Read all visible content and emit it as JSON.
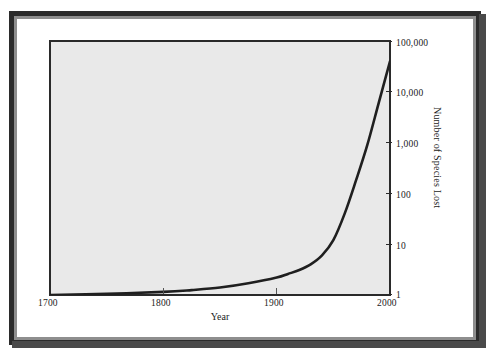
{
  "figure": {
    "background_color": "#ffffff",
    "frame_color": "#2b2b2b",
    "frame_inner_color": "#8e8e8e",
    "plot_background_color": "#e9e9e9",
    "curve_color": "#1f1f1f"
  },
  "chart_data": {
    "type": "line",
    "title": "",
    "subtitle": "",
    "xlabel": "Year",
    "ylabel": "Number of Species Lost",
    "xlim": [
      1700,
      2000
    ],
    "ylim": [
      1,
      100000
    ],
    "yscale": "log",
    "xscale": "linear",
    "grid": false,
    "legend": null,
    "xticks": [
      1700,
      1800,
      1900,
      2000
    ],
    "xtick_labels": [
      "1700",
      "1800",
      "1900",
      "2000"
    ],
    "yticks": [
      1,
      10,
      100,
      1000,
      10000,
      100000
    ],
    "ytick_labels": [
      "1",
      "10",
      "100",
      "1,000",
      "10,000",
      "100,000"
    ],
    "ytick_side": "right",
    "ylabel_side": "right",
    "series": [
      {
        "name": "Species lost",
        "x": [
          1700,
          1750,
          1800,
          1825,
          1850,
          1875,
          1900,
          1910,
          1920,
          1930,
          1940,
          1950,
          1960,
          1970,
          1980,
          1990,
          2000
        ],
        "y": [
          1.0,
          1.05,
          1.15,
          1.25,
          1.4,
          1.7,
          2.2,
          2.6,
          3.1,
          4.0,
          6.0,
          12.0,
          40.0,
          180.0,
          900.0,
          6000.0,
          40000.0
        ]
      }
    ],
    "annotations": []
  },
  "axis": {
    "x_title": "Year",
    "y_title": "Number of Species Lost",
    "x_tick_labels": [
      "1700",
      "1800",
      "1900",
      "2000"
    ],
    "y_tick_labels": [
      "100,000",
      "10,000",
      "1,000",
      "100",
      "10",
      "1"
    ]
  }
}
